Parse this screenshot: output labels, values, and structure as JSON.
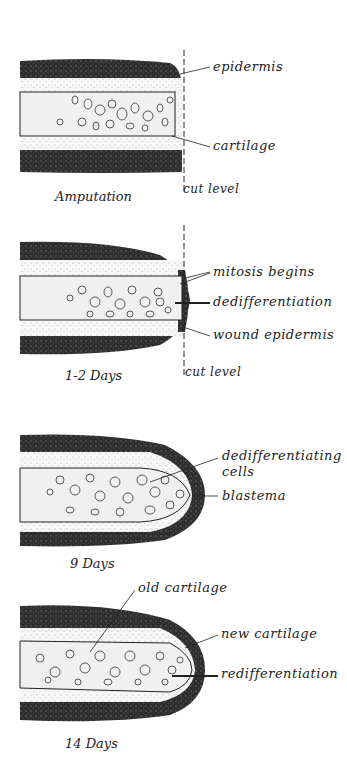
{
  "figure": {
    "panels": [
      {
        "caption": "Amputation",
        "labels": {
          "epidermis": "epidermis",
          "cartilage": "cartilage",
          "cut": "cut level"
        }
      },
      {
        "caption": "1-2 Days",
        "labels": {
          "mitosis": "mitosis begins",
          "dediff": "dedifferentiation",
          "wound": "wound epidermis",
          "cut": "cut level"
        }
      },
      {
        "caption": "9 Days",
        "labels": {
          "cells1": "dedifferentiating",
          "cells2": "cells",
          "blastema": "blastema"
        }
      },
      {
        "caption": "14 Days",
        "labels": {
          "old": "old cartilage",
          "new": "new cartilage",
          "rediff": "redifferentiation"
        }
      }
    ],
    "colors": {
      "epidermis": "#3a3a3a",
      "mesenchyme": "#f2f2f2",
      "cartilage": "#e8e8e8",
      "line": "#222222"
    }
  }
}
